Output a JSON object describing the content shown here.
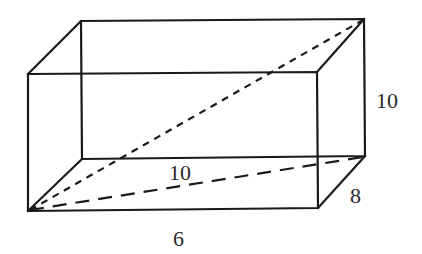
{
  "figure": {
    "type": "rectangular-prism",
    "labels": {
      "height": "10",
      "depth": "8",
      "width": "6",
      "base_diagonal": "10"
    },
    "stroke_color": "#1a1a1a",
    "label_color": "#2a2a2a"
  }
}
